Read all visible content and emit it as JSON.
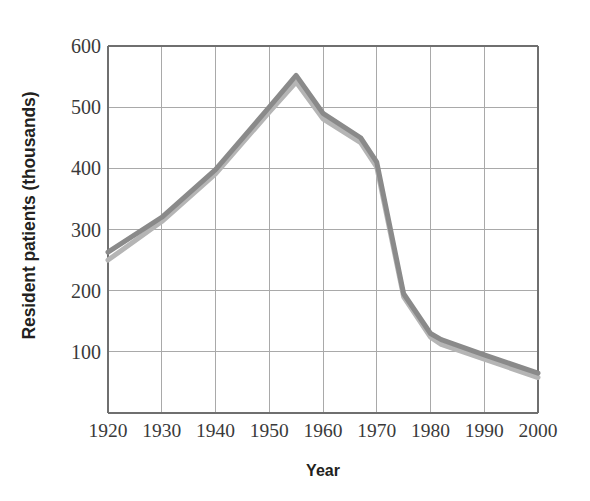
{
  "chart_data": {
    "type": "line",
    "title": "",
    "xlabel": "Year",
    "ylabel": "Resident patients (thousands)",
    "xlim": [
      1920,
      2000
    ],
    "ylim": [
      0,
      600
    ],
    "xticks": [
      1920,
      1930,
      1940,
      1950,
      1960,
      1970,
      1980,
      1990,
      2000
    ],
    "xtick_labels": [
      "1920",
      "1930",
      "1940",
      "1950",
      "1960",
      "1970",
      "1980",
      "1990",
      "2000"
    ],
    "yticks": [
      100,
      200,
      300,
      400,
      500,
      600
    ],
    "ytick_labels": [
      "100",
      "200",
      "300",
      "400",
      "500",
      "600"
    ],
    "grid": true,
    "legend": "none",
    "series": [
      {
        "name": "upper-line",
        "color": "#8a8a8a",
        "x": [
          1920,
          1930,
          1940,
          1950,
          1955,
          1960,
          1967,
          1970,
          1975,
          1980,
          1982,
          1990,
          2000
        ],
        "values": [
          263,
          320,
          398,
          500,
          552,
          490,
          450,
          410,
          195,
          130,
          120,
          95,
          65
        ]
      },
      {
        "name": "lower-line",
        "color": "#b5b5b5",
        "x": [
          1920,
          1930,
          1940,
          1950,
          1955,
          1960,
          1967,
          1970,
          1975,
          1980,
          1982,
          1990,
          2000
        ],
        "values": [
          250,
          313,
          391,
          492,
          541,
          481,
          442,
          402,
          190,
          124,
          112,
          88,
          58
        ]
      }
    ]
  },
  "axes": {
    "x_title": "Year",
    "y_title": "Resident patients (thousands)"
  },
  "colors": {
    "grid": "#a9a9a9",
    "axis": "#6f6f6f",
    "text": "#231f20",
    "tick_text": "#3a3a3a",
    "series_dark": "#8a8a8a",
    "series_light": "#b5b5b5",
    "background": "#ffffff"
  }
}
